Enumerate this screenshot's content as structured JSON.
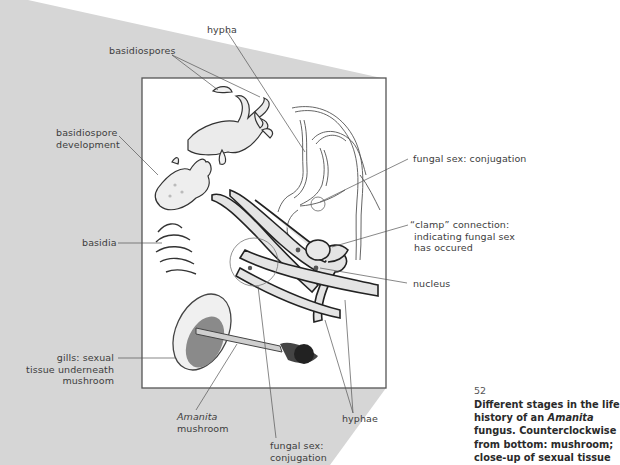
{
  "figure": {
    "number": "52",
    "caption": {
      "line1": "Different stages in the life",
      "line2_pre": "history of an ",
      "line2_italic": "Amanita",
      "line3": "fungus. Counterclockwise",
      "line4": "from bottom: mushroom;",
      "line5": "close-up of sexual tissue"
    }
  },
  "labels": {
    "hypha": "hypha",
    "basidiospores": "basidiospores",
    "basidiospore_development": [
      "basidiospore",
      "development"
    ],
    "basidia": "basidia",
    "gills": [
      "gills: sexual",
      "tissue underneath",
      "mushroom"
    ],
    "amanita": {
      "italic": "Amanita",
      "line2": "mushroom"
    },
    "fungal_sex_bottom": [
      "fungal sex:",
      "conjugation"
    ],
    "hyphae": "hyphae",
    "fungal_sex_right": "fungal sex: conjugation",
    "clamp": [
      "“clamp” connection:",
      "indicating fungal sex",
      "has occured"
    ],
    "nucleus": "nucleus"
  },
  "colors": {
    "projection_gray": "#d6d6d6",
    "box_border": "#555555",
    "leader_line": "#555555",
    "hypha_fill": "#e4e4e4"
  }
}
